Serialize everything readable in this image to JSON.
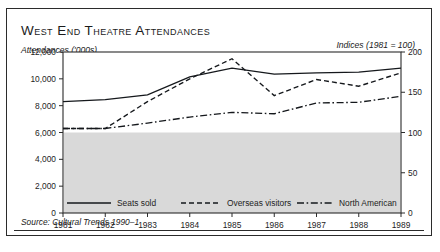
{
  "figure": {
    "title": "West End Theatre Attendances",
    "left_axis_label": "Attendances ('000s)",
    "right_axis_label": "Indices (1981 = 100)",
    "source": "Source: Cultural Trends 1990–1"
  },
  "chart_data": {
    "type": "line",
    "title": "West End Theatre Attendances",
    "xlabel": "",
    "ylabel": "Attendances ('000s)",
    "y2label": "Indices (1981 = 100)",
    "x": [
      1981,
      1982,
      1983,
      1984,
      1985,
      1986,
      1987,
      1988,
      1989
    ],
    "xtick_labels": [
      "1981",
      "1982",
      "1983",
      "1984",
      "1985",
      "1986",
      "1987",
      "1988",
      "1989"
    ],
    "ylim": [
      0,
      12000
    ],
    "yticks": [
      0,
      2000,
      4000,
      6000,
      8000,
      10000,
      12000
    ],
    "ytick_labels": [
      "0",
      "2,000",
      "4,000",
      "6,000",
      "8,000",
      "10,000",
      "12,000"
    ],
    "y2lim": [
      0,
      200
    ],
    "y2ticks": [
      0,
      50,
      100,
      150,
      200
    ],
    "y2tick_labels": [
      "0",
      "50",
      "100",
      "150",
      "200"
    ],
    "grid": false,
    "legend_position": "bottom",
    "shaded_band": {
      "from": 0,
      "to": 6000,
      "color": "#d9d9d9"
    },
    "series": [
      {
        "name": "Seats sold",
        "axis": "left",
        "style": "solid",
        "values": [
          8300,
          8450,
          8800,
          10150,
          10800,
          10350,
          10450,
          10500,
          10800
        ]
      },
      {
        "name": "Overseas visitors",
        "axis": "left",
        "style": "dashed",
        "values": [
          6300,
          6300,
          8300,
          10000,
          11500,
          8750,
          9950,
          9450,
          10450
        ]
      },
      {
        "name": "North American",
        "axis": "left",
        "style": "dashdot",
        "values": [
          6300,
          6300,
          6700,
          7150,
          7500,
          7400,
          8200,
          8250,
          8700
        ]
      }
    ]
  }
}
